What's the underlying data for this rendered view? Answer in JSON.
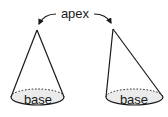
{
  "diagram": {
    "title_label": "apex",
    "cones": [
      {
        "name": "right-cone",
        "base_label": "base"
      },
      {
        "name": "oblique-cone",
        "base_label": "base"
      }
    ],
    "colors": {
      "stroke": "#1a1a1a",
      "base_fill": "#ebebeb",
      "background": "#ffffff"
    }
  }
}
